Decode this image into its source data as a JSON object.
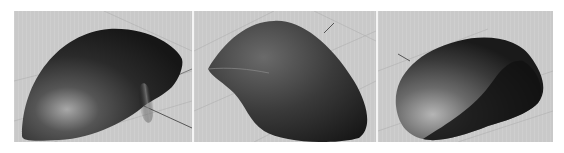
{
  "figure": {
    "panels": [
      {
        "id": "view-1",
        "label": "Side-rear perspective view of mouse shell"
      },
      {
        "id": "view-2",
        "label": "Rear-top perspective view of mouse shell"
      },
      {
        "id": "view-3",
        "label": "Front-side perspective view of mouse shell"
      }
    ],
    "colors": {
      "background": "#ffffff",
      "viewport": "#c9c9c9",
      "grid_line": "#a8a8a8",
      "axis_line": "#555555",
      "model_dark": "#1e1e1e",
      "model_mid": "#4a4a4a",
      "model_highlight": "#9a9a9a",
      "divider": "#f4f4f4"
    }
  }
}
